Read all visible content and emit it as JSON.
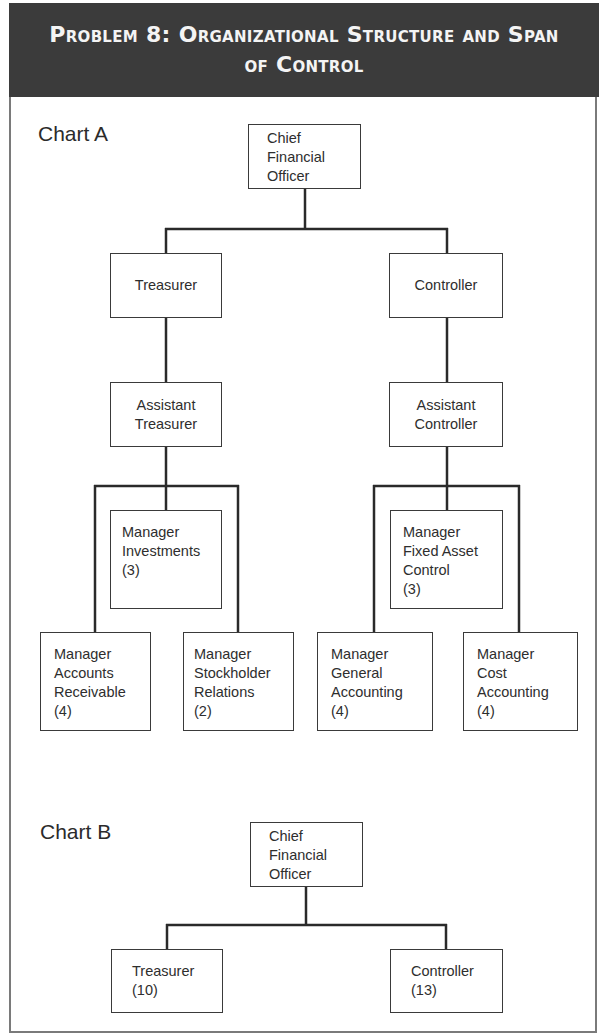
{
  "header": {
    "title_line1": "Problem 8: Organizational Structure and Span",
    "title_line2": "of Control"
  },
  "chart_a": {
    "label": "Chart A",
    "cfo": {
      "lines": [
        "Chief",
        "Financial",
        "Officer"
      ]
    },
    "treasurer": {
      "lines": [
        "Treasurer"
      ]
    },
    "controller": {
      "lines": [
        "Controller"
      ]
    },
    "assistant_treasurer": {
      "lines": [
        "Assistant",
        "Treasurer"
      ]
    },
    "assistant_controller": {
      "lines": [
        "Assistant",
        "Controller"
      ]
    },
    "mgr_investments": {
      "lines": [
        "Manager",
        "Investments",
        "(3)"
      ]
    },
    "mgr_fixed_asset": {
      "lines": [
        "Manager",
        "Fixed Asset",
        "Control",
        "(3)"
      ]
    },
    "mgr_accounts_receivable": {
      "lines": [
        "Manager",
        "Accounts",
        "Receivable",
        "(4)"
      ]
    },
    "mgr_stockholder_relations": {
      "lines": [
        "Manager",
        "Stockholder",
        "Relations",
        "(2)"
      ]
    },
    "mgr_general_accounting": {
      "lines": [
        "Manager",
        "General",
        "Accounting",
        "(4)"
      ]
    },
    "mgr_cost_accounting": {
      "lines": [
        "Manager",
        "Cost",
        "Accounting",
        "(4)"
      ]
    }
  },
  "chart_b": {
    "label": "Chart B",
    "cfo": {
      "lines": [
        "Chief",
        "Financial",
        "Officer"
      ]
    },
    "treasurer": {
      "lines": [
        "Treasurer",
        "(10)"
      ]
    },
    "controller": {
      "lines": [
        "Controller",
        "(13)"
      ]
    }
  },
  "colors": {
    "header_bg": "#3b3b3b",
    "header_text": "#f4f4f4",
    "line": "#2a2a2a",
    "frame": "#7a7a7a"
  }
}
